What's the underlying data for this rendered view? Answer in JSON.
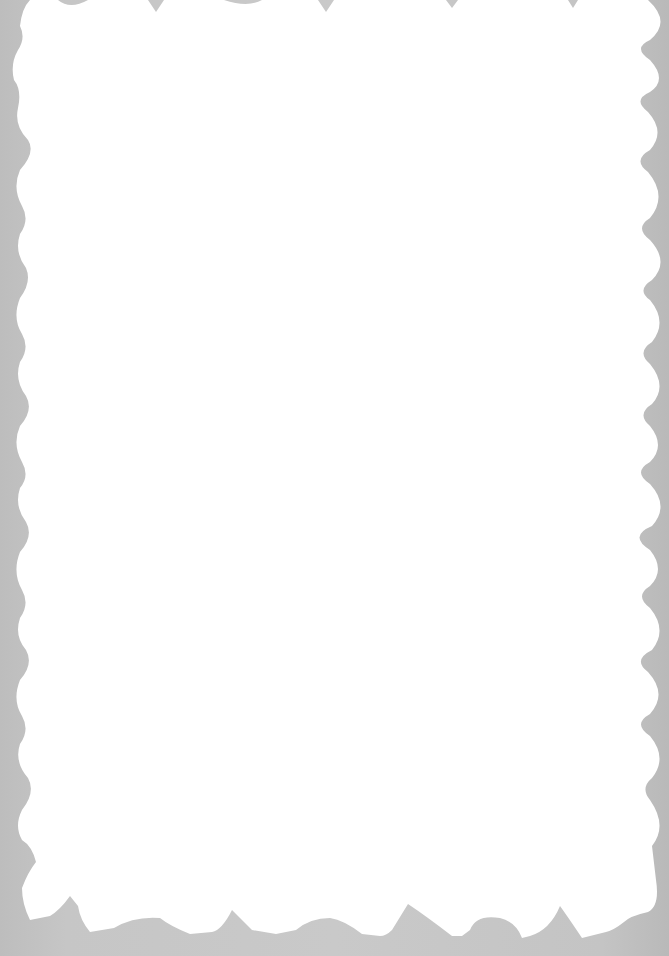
{
  "canvas": {
    "width": 669,
    "height": 956,
    "background_color": "#c6c6c6"
  },
  "frame": {
    "shape": "scalloped-wavy-border",
    "fill_color": "#ffffff",
    "content_text": ""
  }
}
